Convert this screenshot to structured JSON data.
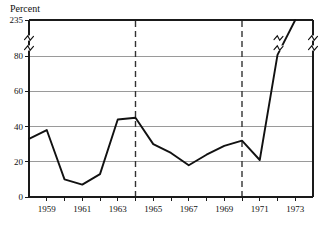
{
  "chart_data": {
    "type": "line",
    "title": "",
    "ylabel": "Percent",
    "xlabel": "",
    "grid": true,
    "legend": "none",
    "axis_break": {
      "present": true,
      "between": [
        80,
        235
      ],
      "note": "y-axis broken between 80 and 235; break squiggles drawn on left axis, on the data line, and on the right axis"
    },
    "ylim": [
      0,
      235
    ],
    "yticks": [
      0,
      20,
      40,
      60,
      80,
      235
    ],
    "ytick_labels": [
      "0",
      "20",
      "40",
      "60",
      "80",
      "235"
    ],
    "xlim": [
      1958,
      1974
    ],
    "xticks": [
      1958,
      1959,
      1960,
      1961,
      1962,
      1963,
      1964,
      1965,
      1966,
      1967,
      1968,
      1969,
      1970,
      1971,
      1972,
      1973,
      1974
    ],
    "xtick_labels": [
      "1959",
      "1961",
      "1963",
      "1965",
      "1967",
      "1969",
      "1971",
      "1973"
    ],
    "xtick_labelled_values": [
      1959,
      1961,
      1963,
      1965,
      1967,
      1969,
      1971,
      1973
    ],
    "x": [
      1958,
      1959,
      1960,
      1961,
      1962,
      1963,
      1964,
      1965,
      1966,
      1967,
      1968,
      1969,
      1970,
      1971,
      1972,
      1973
    ],
    "values": [
      33,
      38,
      10,
      7,
      13,
      44,
      45,
      30,
      25,
      18,
      24,
      29,
      32,
      21,
      85,
      235
    ],
    "series": [
      {
        "name": "Percent",
        "color": "#111111",
        "x": [
          1958,
          1959,
          1960,
          1961,
          1962,
          1963,
          1964,
          1965,
          1966,
          1967,
          1968,
          1969,
          1970,
          1971,
          1972,
          1973
        ],
        "values": [
          33,
          38,
          10,
          7,
          13,
          44,
          45,
          30,
          25,
          18,
          24,
          29,
          32,
          21,
          85,
          235
        ]
      }
    ],
    "annotations": [
      {
        "name": "reference-line-1964",
        "type": "vline",
        "x": 1964,
        "style": "dashed"
      },
      {
        "name": "reference-line-1970",
        "type": "vline",
        "x": 1970,
        "style": "dashed"
      }
    ],
    "colors": {
      "line": "#111111",
      "grid": "#9a9a9a",
      "frame": "#1a1a1a",
      "event": "#333333",
      "background": "#ffffff"
    }
  }
}
